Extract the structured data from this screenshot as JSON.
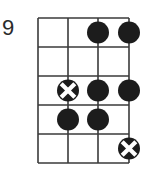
{
  "diagram": {
    "type": "fretboard-scale-diagram",
    "start_fret_label": "9",
    "num_strings": 4,
    "num_frets": 5,
    "grid": {
      "string_x": [
        38,
        68,
        98,
        129
      ],
      "fret_y": [
        18,
        47,
        76,
        105,
        134,
        163
      ],
      "line_color": "#3a3a3a",
      "line_width": 1.6
    },
    "dot_color": "#1c1c1c",
    "root_cross_color": "#ffffff",
    "dot_radius": 11,
    "markers": [
      {
        "fret": 1,
        "string": 3,
        "kind": "note"
      },
      {
        "fret": 1,
        "string": 4,
        "kind": "note"
      },
      {
        "fret": 3,
        "string": 2,
        "kind": "root"
      },
      {
        "fret": 3,
        "string": 3,
        "kind": "note"
      },
      {
        "fret": 3,
        "string": 4,
        "kind": "note"
      },
      {
        "fret": 4,
        "string": 2,
        "kind": "note"
      },
      {
        "fret": 4,
        "string": 3,
        "kind": "note"
      },
      {
        "fret": 5,
        "string": 4,
        "kind": "root"
      }
    ]
  }
}
